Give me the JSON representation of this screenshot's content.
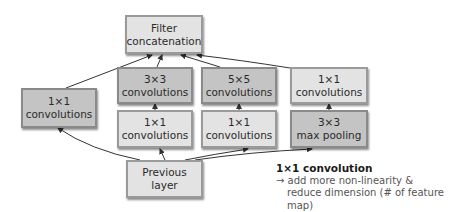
{
  "diagram": {
    "nodes": {
      "filter_concat": {
        "lines": [
          "Filter",
          "concatenation"
        ],
        "shade": "light"
      },
      "conv3x3": {
        "lines": [
          "3×3",
          "convolutions"
        ],
        "shade": "dark"
      },
      "conv5x5": {
        "lines": [
          "5×5",
          "convolutions"
        ],
        "shade": "dark"
      },
      "conv1x1_pool_proj": {
        "lines": [
          "1×1",
          "convolutions"
        ],
        "shade": "light"
      },
      "conv1x1_left": {
        "lines": [
          "1×1",
          "convolutions"
        ],
        "shade": "dark"
      },
      "conv1x1_reduce3": {
        "lines": [
          "1×1",
          "convolutions"
        ],
        "shade": "light"
      },
      "conv1x1_reduce5": {
        "lines": [
          "1×1",
          "convolutions"
        ],
        "shade": "light"
      },
      "maxpool3x3": {
        "lines": [
          "3×3",
          "max pooling"
        ],
        "shade": "dark"
      },
      "previous_layer": {
        "lines": [
          "Previous layer"
        ],
        "shade": "light"
      }
    },
    "edges": [
      {
        "from": "previous_layer",
        "to": "conv1x1_left"
      },
      {
        "from": "previous_layer",
        "to": "conv1x1_reduce3"
      },
      {
        "from": "previous_layer",
        "to": "conv1x1_reduce5"
      },
      {
        "from": "previous_layer",
        "to": "maxpool3x3"
      },
      {
        "from": "conv1x1_reduce3",
        "to": "conv3x3"
      },
      {
        "from": "conv1x1_reduce5",
        "to": "conv5x5"
      },
      {
        "from": "maxpool3x3",
        "to": "conv1x1_pool_proj"
      },
      {
        "from": "conv1x1_left",
        "to": "filter_concat"
      },
      {
        "from": "conv3x3",
        "to": "filter_concat"
      },
      {
        "from": "conv5x5",
        "to": "filter_concat"
      },
      {
        "from": "conv1x1_pool_proj",
        "to": "filter_concat"
      }
    ],
    "annotation": {
      "title": "1×1 convolution",
      "arrow": "→",
      "line1": "add more non-linearity &",
      "line2": "reduce dimension (# of feature map)"
    },
    "colors": {
      "light_box": "#e3e3e3",
      "dark_box": "#c4c4c4",
      "edge": "#333333"
    }
  }
}
